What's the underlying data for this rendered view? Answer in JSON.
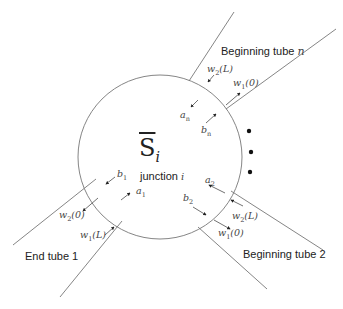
{
  "diagram": {
    "junction": {
      "symbol": "S",
      "symbol_subscript": "i",
      "label": "junction",
      "label_var": "i"
    },
    "tubes": {
      "tube_1": {
        "label": "End tube 1"
      },
      "tube_2": {
        "label": "Beginning tube 2"
      },
      "tube_n": {
        "label": "Beginning  tube",
        "label_var": "n"
      }
    },
    "waves": {
      "a1": {
        "base": "a",
        "sub": "1"
      },
      "b1": {
        "base": "b",
        "sub": "1"
      },
      "a2": {
        "base": "a",
        "sub": "2"
      },
      "b2": {
        "base": "b",
        "sub": "2"
      },
      "an": {
        "base": "a",
        "sub": "n"
      },
      "bn": {
        "base": "b",
        "sub": "n"
      },
      "w2_0_tube1": {
        "base": "w",
        "sub": "2",
        "arg": "(0)"
      },
      "w1_L_tube1": {
        "base": "w",
        "sub": "1",
        "arg": "(L)"
      },
      "w2_L_tube2": {
        "base": "w",
        "sub": "2",
        "arg": "(L)"
      },
      "w1_0_tube2": {
        "base": "w",
        "sub": "1",
        "arg": "(0)"
      },
      "w2_L_tuben": {
        "base": "w",
        "sub": "2",
        "arg": "(L)"
      },
      "w1_0_tuben": {
        "base": "w",
        "sub": "1",
        "arg": "(0)"
      }
    },
    "ellipsis": "•"
  }
}
